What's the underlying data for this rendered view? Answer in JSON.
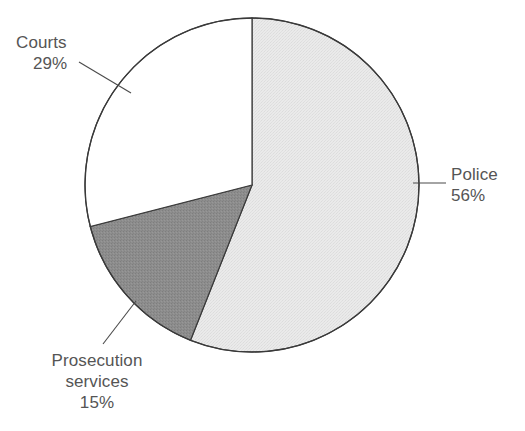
{
  "figure": {
    "kind": "pie-chart",
    "background_color": "#ffffff",
    "label_color": "#555555",
    "outline_color": "#3a3a3a",
    "leader_color": "#4a4a4a"
  },
  "chart_data": {
    "type": "pie",
    "title": "",
    "subtitle": "",
    "xlabel": "",
    "ylabel": "",
    "grid": false,
    "legend_position": "none",
    "labels_outside": true,
    "start_angle_deg": 0,
    "direction": "clockwise",
    "total_percent": 100,
    "units": "percent",
    "categories": [
      "Police",
      "Prosecution services",
      "Courts"
    ],
    "values": [
      56,
      15,
      29
    ],
    "colors": [
      "#e8e8e8",
      "#8a8a8a",
      "#ffffff"
    ],
    "slices": [
      {
        "name": "Police",
        "label": "Police",
        "value": 56,
        "value_label": "56%",
        "color": "#e8e8e8",
        "texture": "fine-dither",
        "start_deg": 0,
        "end_deg": 201.6
      },
      {
        "name": "Prosecution services",
        "label_line1": "Prosecution",
        "label_line2": "services",
        "value": 15,
        "value_label": "15%",
        "color": "#8a8a8a",
        "texture": "fine-dither",
        "start_deg": 201.6,
        "end_deg": 255.6
      },
      {
        "name": "Courts",
        "label": "Courts",
        "value": 29,
        "value_label": "29%",
        "color": "#ffffff",
        "texture": "none",
        "start_deg": 255.6,
        "end_deg": 360
      }
    ]
  },
  "annotations": {
    "police": {
      "line1": "Police",
      "line2": "56%"
    },
    "courts": {
      "line1": "Courts",
      "line2": "29%"
    },
    "prosecution": {
      "line1": "Prosecution",
      "line2": "services",
      "line3": "15%"
    }
  }
}
